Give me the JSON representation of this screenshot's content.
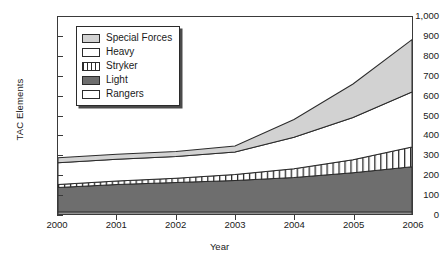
{
  "chart_data": {
    "type": "area",
    "stacked": true,
    "title": "",
    "xlabel": "Year",
    "ylabel": "TAC Elements",
    "x": [
      2000,
      2001,
      2002,
      2003,
      2004,
      2005,
      2006
    ],
    "xtick_labels": [
      "2000",
      "2001",
      "2002",
      "2003",
      "2004",
      "2005",
      "2006"
    ],
    "xlim": [
      2000,
      2006
    ],
    "ylim": [
      0,
      1000
    ],
    "ytick_labels": [
      "0",
      "100",
      "200",
      "300",
      "400",
      "500",
      "600",
      "700",
      "800",
      "900",
      "1,000"
    ],
    "ytick_values": [
      0,
      100,
      200,
      300,
      400,
      500,
      600,
      700,
      800,
      900,
      1000
    ],
    "grid": false,
    "legend_position": "upper-left-inside",
    "stack_order_bottom_to_top": [
      "Rangers",
      "Light",
      "Stryker",
      "Heavy",
      "Special Forces"
    ],
    "series": [
      {
        "name": "Rangers",
        "fill": "#ffffff",
        "pattern": "solid",
        "values": [
          10,
          10,
          10,
          10,
          10,
          10,
          10
        ]
      },
      {
        "name": "Light",
        "fill": "#6e6e6e",
        "pattern": "solid",
        "values": [
          125,
          140,
          150,
          160,
          175,
          200,
          230
        ]
      },
      {
        "name": "Stryker",
        "fill": "#ffffff",
        "pattern": "vertical-stripes",
        "values": [
          15,
          18,
          22,
          30,
          45,
          65,
          100
        ]
      },
      {
        "name": "Heavy",
        "fill": "#ffffff",
        "pattern": "solid",
        "values": [
          110,
          110,
          110,
          115,
          160,
          215,
          280
        ]
      },
      {
        "name": "Special Forces",
        "fill": "#d2d2d2",
        "pattern": "solid",
        "values": [
          25,
          25,
          25,
          30,
          90,
          170,
          265
        ]
      }
    ],
    "cumulative_totals": [
      285,
      303,
      317,
      345,
      480,
      660,
      885
    ],
    "colors": {
      "special_forces": "#d2d2d2",
      "heavy": "#ffffff",
      "stryker": "#ffffff",
      "light": "#6e6e6e",
      "rangers": "#ffffff",
      "outline": "#2b2b2b",
      "axis": "#3a3a3a"
    }
  },
  "legend": {
    "items": [
      {
        "label": "Special Forces",
        "swatch": "special-forces-swatch"
      },
      {
        "label": "Heavy",
        "swatch": "heavy-swatch"
      },
      {
        "label": "Stryker",
        "swatch": "stryker-swatch"
      },
      {
        "label": "Light",
        "swatch": "light-swatch"
      },
      {
        "label": "Rangers",
        "swatch": "rangers-swatch"
      }
    ]
  }
}
